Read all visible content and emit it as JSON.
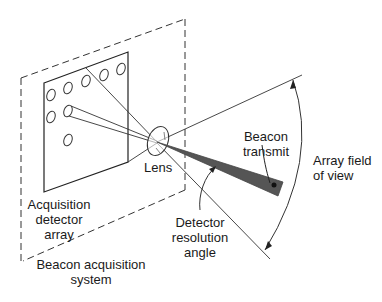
{
  "diagram": {
    "title": "",
    "elements": {
      "system_boundary": "Beacon acquisition system",
      "detector_array": "Acquisition detector array",
      "lens": "Lens",
      "beacon": "Beacon transmit",
      "field_of_view": "Array field of view",
      "resolution_angle": "Detector resolution angle"
    },
    "labels": {
      "lens": "Lens",
      "beacon_line1": "Beacon",
      "beacon_line2": "transmit",
      "fov_line1": "Array field",
      "fov_line2": "of view",
      "acq_line1": "Acquisition",
      "acq_line2": "detector",
      "acq_line3": "array",
      "res_line1": "Detector",
      "res_line2": "resolution",
      "res_line3": "angle",
      "sys_line1": "Beacon acquisition",
      "sys_line2": "system"
    },
    "detector_count": 10,
    "colors": {
      "line": "#333333",
      "beam": "#555555",
      "background": "#ffffff"
    }
  }
}
